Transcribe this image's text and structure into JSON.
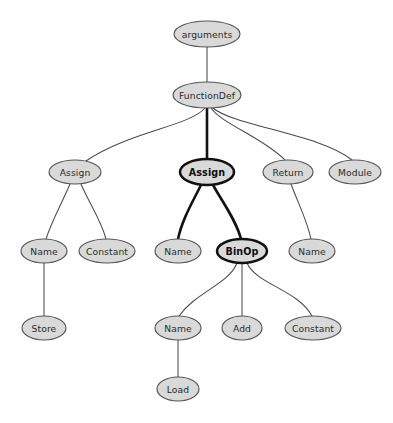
{
  "graph": {
    "title": "Python AST syntax tree",
    "background_color": "#ffffff",
    "node_fill_color": "#d9d9d9",
    "node_stroke_color": "#555555",
    "highlight_stroke_color": "#101010",
    "edge_color": "#4a4a4a",
    "highlight_edge_color": "#121212",
    "node_count": 16,
    "edge_count": 15,
    "nodes": [
      {
        "id": "arguments",
        "label": "arguments",
        "cx": 207,
        "cy": 34,
        "rx": 33,
        "ry": 13,
        "highlighted": false
      },
      {
        "id": "functiondef",
        "label": "FunctionDef",
        "cx": 207,
        "cy": 95,
        "rx": 34,
        "ry": 13,
        "highlighted": false
      },
      {
        "id": "assign_l",
        "label": "Assign",
        "cx": 75,
        "cy": 172,
        "rx": 26,
        "ry": 12,
        "highlighted": false
      },
      {
        "id": "assign_m",
        "label": "Assign",
        "cx": 207,
        "cy": 172,
        "rx": 27,
        "ry": 13,
        "highlighted": true
      },
      {
        "id": "return",
        "label": "Return",
        "cx": 288,
        "cy": 172,
        "rx": 25,
        "ry": 12,
        "highlighted": false
      },
      {
        "id": "module",
        "label": "Module",
        "cx": 355,
        "cy": 172,
        "rx": 26,
        "ry": 12,
        "highlighted": false
      },
      {
        "id": "name_1",
        "label": "Name",
        "cx": 44,
        "cy": 251,
        "rx": 23,
        "ry": 12,
        "highlighted": false
      },
      {
        "id": "constant_1",
        "label": "Constant",
        "cx": 107,
        "cy": 251,
        "rx": 28,
        "ry": 12,
        "highlighted": false
      },
      {
        "id": "name_2",
        "label": "Name",
        "cx": 178,
        "cy": 251,
        "rx": 23,
        "ry": 12,
        "highlighted": false
      },
      {
        "id": "binop",
        "label": "BinOp",
        "cx": 242,
        "cy": 251,
        "rx": 25,
        "ry": 12,
        "highlighted": true
      },
      {
        "id": "name_3",
        "label": "Name",
        "cx": 312,
        "cy": 251,
        "rx": 23,
        "ry": 12,
        "highlighted": false
      },
      {
        "id": "store",
        "label": "Store",
        "cx": 44,
        "cy": 328,
        "rx": 22,
        "ry": 12,
        "highlighted": false
      },
      {
        "id": "name_4",
        "label": "Name",
        "cx": 178,
        "cy": 328,
        "rx": 23,
        "ry": 12,
        "highlighted": false
      },
      {
        "id": "add",
        "label": "Add",
        "cx": 242,
        "cy": 328,
        "rx": 20,
        "ry": 12,
        "highlighted": false
      },
      {
        "id": "constant_2",
        "label": "Constant",
        "cx": 313,
        "cy": 328,
        "rx": 28,
        "ry": 12,
        "highlighted": false
      },
      {
        "id": "load",
        "label": "Load",
        "cx": 178,
        "cy": 389,
        "rx": 21,
        "ry": 12,
        "highlighted": false
      }
    ],
    "edges": [
      {
        "id": "e-arguments-functiondef",
        "from": "arguments",
        "to": "functiondef",
        "path": "M 207 47 C 207 60, 207 70, 207 82",
        "bold": false
      },
      {
        "id": "e-functiondef-assign_l",
        "from": "functiondef",
        "to": "assign_l",
        "path": "M 205 108 C 190 126, 128 132, 86 161",
        "bold": false
      },
      {
        "id": "e-functiondef-assign_m",
        "from": "functiondef",
        "to": "assign_m",
        "path": "M 207 108 L 207 159",
        "bold": true
      },
      {
        "id": "e-functiondef-return",
        "from": "functiondef",
        "to": "return",
        "path": "M 211 108 C 222 124, 262 137, 285 160",
        "bold": false
      },
      {
        "id": "e-functiondef-module",
        "from": "functiondef",
        "to": "module",
        "path": "M 213 108 C 234 126, 320 134, 352 160",
        "bold": false
      },
      {
        "id": "e-assign_l-name_1",
        "from": "assign_l",
        "to": "name_1",
        "path": "M 70 184 C 62 203, 52 220, 46 239",
        "bold": false
      },
      {
        "id": "e-assign_l-constant_1",
        "from": "assign_l",
        "to": "constant_1",
        "path": "M 81 184 C 89 203, 101 220, 106 239",
        "bold": false
      },
      {
        "id": "e-assign_m-name_2",
        "from": "assign_m",
        "to": "name_2",
        "path": "M 201 185 C 192 203, 182 220, 178 239",
        "bold": true
      },
      {
        "id": "e-assign_m-binop",
        "from": "assign_m",
        "to": "binop",
        "path": "M 213 185 C 223 203, 236 220, 241 239",
        "bold": true
      },
      {
        "id": "e-return-name_3",
        "from": "return",
        "to": "name_3",
        "path": "M 291 184 C 298 203, 307 220, 311 239",
        "bold": false
      },
      {
        "id": "e-name_1-store",
        "from": "name_1",
        "to": "store",
        "path": "M 44 263 L 44 316",
        "bold": false
      },
      {
        "id": "e-binop-name_4",
        "from": "binop",
        "to": "name_4",
        "path": "M 237 263 C 229 284, 196 292, 179 316",
        "bold": false
      },
      {
        "id": "e-binop-add",
        "from": "binop",
        "to": "add",
        "path": "M 242 263 L 242 316",
        "bold": false
      },
      {
        "id": "e-binop-constant_2",
        "from": "binop",
        "to": "constant_2",
        "path": "M 247 263 C 256 284, 298 290, 312 316",
        "bold": false
      },
      {
        "id": "e-name_4-load",
        "from": "name_4",
        "to": "load",
        "path": "M 178 340 L 178 377",
        "bold": false
      }
    ]
  }
}
